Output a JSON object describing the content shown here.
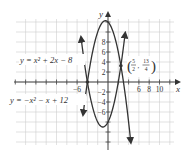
{
  "chart_data": {
    "type": "line",
    "title": "",
    "xlabel": "x",
    "ylabel": "y",
    "xlim": [
      -18,
      12.5
    ],
    "ylim": [
      -12.5,
      12.5
    ],
    "grid": true,
    "x_tick_labels": [
      "-6",
      "6",
      "8",
      "10"
    ],
    "y_tick_labels": [
      "8",
      "6",
      "4",
      "2",
      "-2",
      "-4",
      "-6"
    ],
    "series": [
      {
        "name": "y = x^2 + 2x - 8",
        "label": "y = x² + 2x − 8",
        "expression": "x^2 + 2x - 8",
        "x_range": [
          -5.2,
          3.3
        ]
      },
      {
        "name": "y = -x^2 - x + 12",
        "label": "y = −x² − x + 12",
        "expression": "-x^2 - x + 12",
        "x_range": [
          -4.8,
          4.4
        ]
      }
    ],
    "annotations": [
      {
        "point": [
          -4,
          0
        ],
        "label": ""
      },
      {
        "point": [
          2.5,
          3.25
        ],
        "label": "(5/2, 13/4)",
        "num_x": "5",
        "den_x": "2",
        "num_y": "13",
        "den_y": "4"
      }
    ]
  },
  "labels": {
    "eq1_text": "y = x² + 2x − 8",
    "eq2_text": "y = −x² − x + 12",
    "x_axis": "x",
    "y_axis": "y",
    "point_num_x": "5",
    "point_den_x": "2",
    "point_num_y": "13",
    "point_den_y": "4"
  }
}
